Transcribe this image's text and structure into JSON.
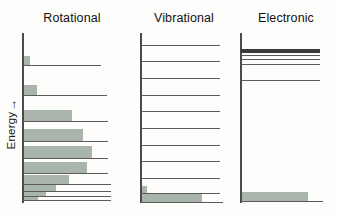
{
  "figure": {
    "background": "#fdfdfb",
    "line_color": "#5b5b5b",
    "axis_color": "#4a4a4a",
    "occupancy_color": "#a9b5ac",
    "dark_band_color": "#3a3a3a"
  },
  "axis": {
    "label": "Energy",
    "arrow": "→",
    "direction": "upward",
    "name": "energy-axis"
  },
  "panels": [
    {
      "id": "rotational",
      "title": "Rotational",
      "axis_name": "rotational-energy-axis",
      "line_right_extent_px": 112,
      "levels": [
        {
          "y": 32,
          "width": 78,
          "thickness": 1.1
        },
        {
          "y": 62,
          "width": 84,
          "thickness": 1.1
        },
        {
          "y": 88,
          "width": 85,
          "thickness": 1.1
        },
        {
          "y": 108,
          "width": 85,
          "thickness": 1.1
        },
        {
          "y": 125,
          "width": 85,
          "thickness": 1.2
        },
        {
          "y": 140,
          "width": 85,
          "thickness": 1.2
        },
        {
          "y": 151,
          "width": 88,
          "thickness": 1.2
        },
        {
          "y": 158,
          "width": 88,
          "thickness": 1.3
        },
        {
          "y": 163,
          "width": 88,
          "thickness": 1.3
        },
        {
          "y": 167,
          "width": 88,
          "thickness": 1.4
        }
      ],
      "occupancies": [
        {
          "y": 23,
          "width": 6,
          "height": 9
        },
        {
          "y": 52,
          "width": 13,
          "height": 10
        },
        {
          "y": 77,
          "width": 48,
          "height": 11
        },
        {
          "y": 96,
          "width": 59,
          "height": 12
        },
        {
          "y": 113,
          "width": 68,
          "height": 12
        },
        {
          "y": 129,
          "width": 63,
          "height": 11
        },
        {
          "y": 142,
          "width": 45,
          "height": 9
        },
        {
          "y": 152,
          "width": 32,
          "height": 6
        },
        {
          "y": 159,
          "width": 22,
          "height": 4
        },
        {
          "y": 164,
          "width": 14,
          "height": 3
        }
      ]
    },
    {
      "id": "vibrational",
      "title": "Vibrational",
      "axis_name": "vibrational-energy-axis",
      "line_right_extent_px": 80,
      "levels": [
        {
          "y": 12,
          "width": 79,
          "thickness": 1.1
        },
        {
          "y": 28,
          "width": 79,
          "thickness": 1.1
        },
        {
          "y": 45,
          "width": 79,
          "thickness": 1.1
        },
        {
          "y": 62,
          "width": 79,
          "thickness": 1.1
        },
        {
          "y": 78,
          "width": 79,
          "thickness": 1.1
        },
        {
          "y": 95,
          "width": 79,
          "thickness": 1.1
        },
        {
          "y": 112,
          "width": 79,
          "thickness": 1.1
        },
        {
          "y": 128,
          "width": 79,
          "thickness": 1.1
        },
        {
          "y": 145,
          "width": 79,
          "thickness": 1.1
        },
        {
          "y": 160,
          "width": 79,
          "thickness": 1.1
        },
        {
          "y": 169,
          "width": 82,
          "thickness": 1.3
        }
      ],
      "occupancies": [
        {
          "y": 153,
          "width": 5,
          "height": 7
        },
        {
          "y": 160,
          "width": 60,
          "height": 9
        }
      ]
    },
    {
      "id": "electronic",
      "title": "Electronic",
      "axis_name": "electronic-energy-axis",
      "line_right_extent_px": 82,
      "levels": [
        {
          "y": 16,
          "width": 79,
          "thickness": 3.6,
          "color": "#3a3a3a"
        },
        {
          "y": 22,
          "width": 79,
          "thickness": 1.2
        },
        {
          "y": 26,
          "width": 79,
          "thickness": 1.2
        },
        {
          "y": 31,
          "width": 79,
          "thickness": 1.2
        },
        {
          "y": 47,
          "width": 79,
          "thickness": 1.2
        },
        {
          "y": 168,
          "width": 82,
          "thickness": 1.4
        }
      ],
      "occupancies": [
        {
          "y": 159,
          "width": 66,
          "height": 9
        }
      ]
    }
  ]
}
